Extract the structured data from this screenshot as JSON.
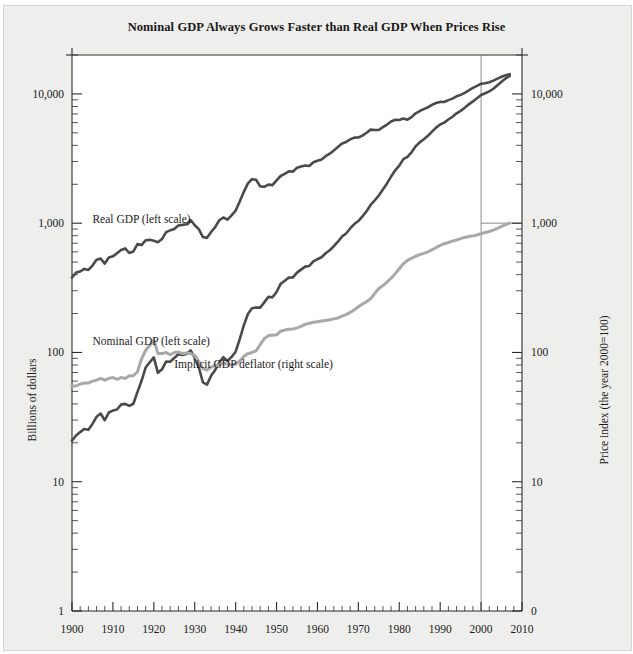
{
  "figure": {
    "title": "Nominal GDP Always Grows Faster than Real GDP When Prices Rise",
    "left_axis_title": "Billions of dollars",
    "right_axis_title": "Price index (the year 2000=100)"
  },
  "chart_data": {
    "type": "line",
    "title": "Nominal GDP Always Grows Faster than Real GDP When Prices Rise",
    "xlabel": "",
    "ylabel": "Billions of dollars",
    "y2label": "Price index (the year 2000=100)",
    "yscale": "log",
    "ylim": [
      1,
      20000
    ],
    "y2lim": [
      0.1,
      2000
    ],
    "xlim": [
      1900,
      2010
    ],
    "grid": false,
    "legend": "inline-annotations",
    "y_ticks": [
      "1",
      "10",
      "100",
      "1,000",
      "10,000"
    ],
    "y_tick_values": [
      1,
      10,
      100,
      1000,
      10000
    ],
    "y2_ticks": [
      "0",
      "10",
      "100",
      "1,000",
      "10,000"
    ],
    "y2_tick_values": [
      0.1,
      1,
      10,
      100,
      1000
    ],
    "x_ticks": [
      "1900",
      "1910",
      "1920",
      "1930",
      "1940",
      "1950",
      "1960",
      "1970",
      "1980",
      "1990",
      "2000",
      "2010"
    ],
    "x_tick_values": [
      1900,
      1910,
      1920,
      1930,
      1940,
      1950,
      1960,
      1970,
      1980,
      1990,
      2000,
      2010
    ],
    "x_minor_step": 2,
    "reference_lines": [
      {
        "type": "vertical",
        "value": 2000
      },
      {
        "type": "horizontal",
        "axis": "right",
        "value": 100,
        "from_x": 2000
      }
    ],
    "series": [
      {
        "name": "Real GDP (left scale)",
        "color": "#4a4a4a",
        "axis": "left",
        "label_x": 1905,
        "label_y": 1000,
        "x": [
          1900,
          1901,
          1902,
          1903,
          1904,
          1905,
          1906,
          1907,
          1908,
          1909,
          1910,
          1911,
          1912,
          1913,
          1914,
          1915,
          1916,
          1917,
          1918,
          1919,
          1920,
          1921,
          1922,
          1923,
          1924,
          1925,
          1926,
          1927,
          1928,
          1929,
          1930,
          1931,
          1932,
          1933,
          1934,
          1935,
          1936,
          1937,
          1938,
          1939,
          1940,
          1941,
          1942,
          1943,
          1944,
          1945,
          1946,
          1947,
          1948,
          1949,
          1950,
          1951,
          1952,
          1953,
          1954,
          1955,
          1956,
          1957,
          1958,
          1959,
          1960,
          1961,
          1962,
          1963,
          1964,
          1965,
          1966,
          1967,
          1968,
          1969,
          1970,
          1971,
          1972,
          1973,
          1974,
          1975,
          1976,
          1977,
          1978,
          1979,
          1980,
          1981,
          1982,
          1983,
          1984,
          1985,
          1986,
          1987,
          1988,
          1989,
          1990,
          1991,
          1992,
          1993,
          1994,
          1995,
          1996,
          1997,
          1998,
          1999,
          2000,
          2001,
          2002,
          2003,
          2004,
          2005,
          2006,
          2007
        ],
        "y": [
          380,
          415,
          423,
          443,
          435,
          470,
          522,
          532,
          487,
          543,
          554,
          585,
          621,
          638,
          588,
          604,
          690,
          677,
          738,
          743,
          730,
          713,
          754,
          853,
          880,
          902,
          961,
          971,
          981,
          1057,
          963,
          899,
          781,
          770,
          855,
          932,
          1053,
          1107,
          1065,
          1151,
          1251,
          1473,
          1748,
          2031,
          2189,
          2167,
          1928,
          1909,
          1987,
          1970,
          2144,
          2318,
          2408,
          2520,
          2504,
          2684,
          2741,
          2798,
          2773,
          2964,
          3039,
          3111,
          3301,
          3445,
          3645,
          3880,
          4132,
          4246,
          4452,
          4592,
          4604,
          4754,
          5007,
          5293,
          5264,
          5253,
          5538,
          5791,
          6113,
          6305,
          6292,
          6451,
          6321,
          6609,
          7081,
          7374,
          7628,
          7886,
          8216,
          8510,
          8675,
          8653,
          8954,
          9199,
          9577,
          9828,
          10202,
          10659,
          11122,
          11555,
          11982,
          12109,
          12320,
          12672,
          13143,
          13567,
          13939,
          14226
        ]
      },
      {
        "name": "Nominal GDP (left scale)",
        "color": "#4a4a4a",
        "axis": "left",
        "label_x": 1905,
        "label_y": 115,
        "x": [
          1900,
          1901,
          1902,
          1903,
          1904,
          1905,
          1906,
          1907,
          1908,
          1909,
          1910,
          1911,
          1912,
          1913,
          1914,
          1915,
          1916,
          1917,
          1918,
          1919,
          1920,
          1921,
          1922,
          1923,
          1924,
          1925,
          1926,
          1927,
          1928,
          1929,
          1930,
          1931,
          1932,
          1933,
          1934,
          1935,
          1936,
          1937,
          1938,
          1939,
          1940,
          1941,
          1942,
          1943,
          1944,
          1945,
          1946,
          1947,
          1948,
          1949,
          1950,
          1951,
          1952,
          1953,
          1954,
          1955,
          1956,
          1957,
          1958,
          1959,
          1960,
          1961,
          1962,
          1963,
          1964,
          1965,
          1966,
          1967,
          1968,
          1969,
          1970,
          1971,
          1972,
          1973,
          1974,
          1975,
          1976,
          1977,
          1978,
          1979,
          1980,
          1981,
          1982,
          1983,
          1984,
          1985,
          1986,
          1987,
          1988,
          1989,
          1990,
          1991,
          1992,
          1993,
          1994,
          1995,
          1996,
          1997,
          1998,
          1999,
          2000,
          2001,
          2002,
          2003,
          2004,
          2005,
          2006,
          2007
        ],
        "y": [
          20.8,
          22.8,
          24.2,
          25.6,
          25.2,
          28.0,
          31.8,
          33.7,
          29.9,
          34.3,
          35.5,
          36.2,
          39.5,
          40.0,
          38.6,
          40.1,
          49.3,
          60.4,
          76.4,
          84.0,
          91.5,
          69.6,
          74.1,
          85.1,
          84.7,
          90.6,
          96.9,
          95.5,
          97.4,
          103.6,
          91.2,
          76.5,
          58.7,
          56.4,
          66.0,
          73.3,
          83.8,
          91.9,
          86.1,
          92.2,
          101.4,
          126.7,
          161.9,
          198.6,
          219.8,
          223.0,
          222.2,
          244.1,
          269.1,
          267.2,
          293.7,
          339.3,
          358.3,
          379.3,
          380.4,
          414.7,
          437.4,
          461.1,
          467.2,
          506.6,
          526.4,
          544.7,
          585.6,
          617.7,
          663.6,
          719.1,
          787.8,
          832.6,
          910.0,
          984.6,
          1038.5,
          1127.1,
          1238.3,
          1382.7,
          1500.0,
          1638.3,
          1825.3,
          2030.9,
          2294.7,
          2563.3,
          2789.5,
          3128.4,
          3255.0,
          3536.7,
          3933.2,
          4220.3,
          4462.8,
          4739.5,
          5103.8,
          5484.4,
          5803.1,
          5995.9,
          6337.7,
          6657.4,
          7072.2,
          7397.7,
          7816.9,
          8304.3,
          8747.0,
          9268.4,
          9817.0,
          10128.0,
          10469.6,
          10960.8,
          11685.9,
          12421.9,
          13178.4,
          13807.5
        ]
      },
      {
        "name": "Implicit GDP deflator (right scale)",
        "color": "#a8a8a8",
        "axis": "right",
        "label_x": 1925,
        "label_y": 7.6,
        "x": [
          1900,
          1901,
          1902,
          1903,
          1904,
          1905,
          1906,
          1907,
          1908,
          1909,
          1910,
          1911,
          1912,
          1913,
          1914,
          1915,
          1916,
          1917,
          1918,
          1919,
          1920,
          1921,
          1922,
          1923,
          1924,
          1925,
          1926,
          1927,
          1928,
          1929,
          1930,
          1931,
          1932,
          1933,
          1934,
          1935,
          1936,
          1937,
          1938,
          1939,
          1940,
          1941,
          1942,
          1943,
          1944,
          1945,
          1946,
          1947,
          1948,
          1949,
          1950,
          1951,
          1952,
          1953,
          1954,
          1955,
          1956,
          1957,
          1958,
          1959,
          1960,
          1961,
          1962,
          1963,
          1964,
          1965,
          1966,
          1967,
          1968,
          1969,
          1970,
          1971,
          1972,
          1973,
          1974,
          1975,
          1976,
          1977,
          1978,
          1979,
          1980,
          1981,
          1982,
          1983,
          1984,
          1985,
          1986,
          1987,
          1988,
          1989,
          1990,
          1991,
          1992,
          1993,
          1994,
          1995,
          1996,
          1997,
          1998,
          1999,
          2000,
          2001,
          2002,
          2003,
          2004,
          2005,
          2006,
          2007
        ],
        "y": [
          5.5,
          5.5,
          5.7,
          5.8,
          5.8,
          6.0,
          6.1,
          6.3,
          6.1,
          6.3,
          6.4,
          6.2,
          6.4,
          6.3,
          6.6,
          6.6,
          7.1,
          8.9,
          10.4,
          11.3,
          12.5,
          9.8,
          9.8,
          10.0,
          9.6,
          10.0,
          10.1,
          9.8,
          9.9,
          9.8,
          9.5,
          8.5,
          7.5,
          7.3,
          7.7,
          7.9,
          8.0,
          8.3,
          8.1,
          8.0,
          8.1,
          8.6,
          9.3,
          9.8,
          10.0,
          10.3,
          11.5,
          12.8,
          13.5,
          13.6,
          13.7,
          14.6,
          14.9,
          15.1,
          15.2,
          15.5,
          15.9,
          16.5,
          16.8,
          17.1,
          17.3,
          17.5,
          17.7,
          17.9,
          18.2,
          18.5,
          19.1,
          19.6,
          20.4,
          21.4,
          22.6,
          23.7,
          24.7,
          26.1,
          28.6,
          31.2,
          32.9,
          35.0,
          37.5,
          40.7,
          44.4,
          48.5,
          51.5,
          53.5,
          55.5,
          57.2,
          58.4,
          60.0,
          62.3,
          64.8,
          67.4,
          69.4,
          70.9,
          72.6,
          74.2,
          75.9,
          77.6,
          78.9,
          79.8,
          81.1,
          83.0,
          84.6,
          86.2,
          88.5,
          91.3,
          94.3,
          97.3,
          100.3
        ]
      }
    ]
  }
}
